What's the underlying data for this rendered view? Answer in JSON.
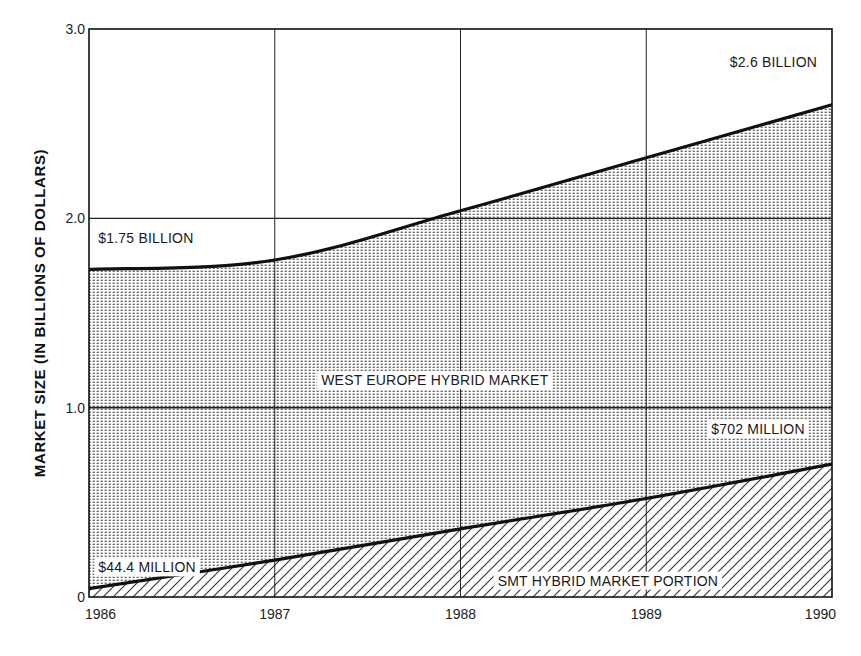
{
  "chart_data": {
    "type": "area",
    "title": "",
    "xlabel": "",
    "ylabel": "MARKET SIZE (IN BILLIONS OF DOLLARS)",
    "x": [
      1986,
      1987,
      1988,
      1989,
      1990
    ],
    "x_tick_labels": [
      "1986",
      "1987",
      "1988",
      "1989",
      "1990"
    ],
    "y_ticks": [
      0,
      1.0,
      2.0,
      3.0
    ],
    "y_tick_labels": [
      "0",
      "1.0",
      "2.0",
      "3.0"
    ],
    "ylim": [
      0,
      3.0
    ],
    "xlim": [
      1986,
      1990
    ],
    "grid": true,
    "legend": null,
    "series": [
      {
        "name": "WEST EUROPE HYBRID MARKET",
        "pattern": "dots",
        "values": [
          1.73,
          1.78,
          2.04,
          2.32,
          2.6
        ]
      },
      {
        "name": "SMT HYBRID MARKET PORTION",
        "pattern": "diagonal-hatch",
        "values": [
          0.0444,
          0.195,
          0.36,
          0.52,
          0.702
        ]
      }
    ],
    "annotations": [
      {
        "id": "start_total",
        "text": "$1.75 BILLION",
        "x": 1986.05,
        "y": 1.87
      },
      {
        "id": "end_total",
        "text": "$2.6 BILLION",
        "x": 1989.45,
        "y": 2.8
      },
      {
        "id": "start_smt",
        "text": "$44.4 MILLION",
        "x": 1986.05,
        "y": 0.13
      },
      {
        "id": "end_smt",
        "text": "$702 MILLION",
        "x": 1989.35,
        "y": 0.86
      },
      {
        "id": "region_total",
        "text": "WEST EUROPE HYBRID MARKET",
        "x": 1987.25,
        "y": 1.12
      },
      {
        "id": "region_smt",
        "text": "SMT HYBRID MARKET PORTION",
        "x": 1988.2,
        "y": 0.06
      }
    ]
  },
  "colors": {
    "ink": "#111111",
    "grid": "#1a1a1a",
    "background": "#ffffff",
    "dot_fill": "#555555",
    "hatch": "#333333"
  }
}
